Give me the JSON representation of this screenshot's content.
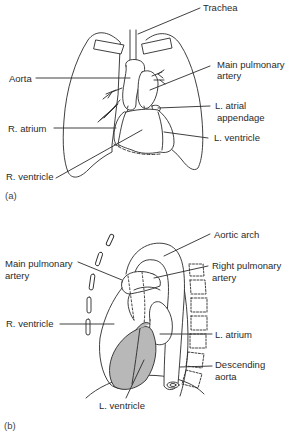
{
  "panel_a": {
    "tag": "(a)",
    "labels": {
      "trachea": "Trachea",
      "aorta": "Aorta",
      "main_pulmonary_artery_1": "Main pulmonary",
      "main_pulmonary_artery_2": "artery",
      "l_atrial_appendage_1": "L. atrial",
      "l_atrial_appendage_2": "appendage",
      "r_atrium": "R. atrium",
      "l_ventricle": "L. ventricle",
      "r_ventricle": "R. ventricle"
    }
  },
  "panel_b": {
    "tag": "(b)",
    "labels": {
      "aortic_arch": "Aortic arch",
      "main_pulmonary_artery_1": "Main pulmonary",
      "main_pulmonary_artery_2": "artery",
      "right_pulmonary_artery_1": "Right pulmonary",
      "right_pulmonary_artery_2": "artery",
      "r_ventricle": "R. ventricle",
      "l_atrium": "L. atrium",
      "descending_aorta_1": "Descending",
      "descending_aorta_2": "aorta",
      "l_ventricle": "L. ventricle"
    }
  },
  "colors": {
    "line": "#2a2a2a",
    "shade": "#b8b8b8",
    "background": "#ffffff"
  }
}
